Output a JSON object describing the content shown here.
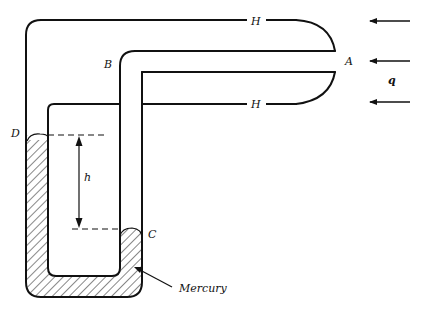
{
  "diagram": {
    "type": "pitot-static manometer",
    "labels": {
      "A": "A",
      "B": "B",
      "C": "C",
      "D": "D",
      "H_top": "H",
      "H_bottom": "H",
      "h": "h",
      "q": "q",
      "mercury": "Mercury"
    },
    "colors": {
      "line": "#111111",
      "background": "#ffffff",
      "hatch": "#111111"
    },
    "flow_arrows": 3
  }
}
